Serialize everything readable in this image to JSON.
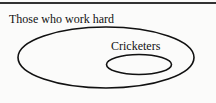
{
  "diagram": {
    "type": "venn",
    "sets": [
      {
        "label": "Those who work hard",
        "role": "outer"
      },
      {
        "label": "Cricketers",
        "role": "inner",
        "subset_of": "Those who work hard"
      }
    ],
    "colors": {
      "stroke": "#111111",
      "background": "#fbfbfa"
    }
  }
}
